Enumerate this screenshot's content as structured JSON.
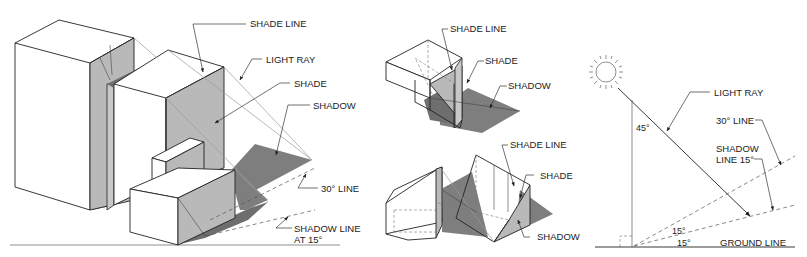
{
  "figure": {
    "left_panel": {
      "labels": {
        "shade_line": "SHADE LINE",
        "light_ray": "LIGHT RAY",
        "shade": "SHADE",
        "shadow": "SHADOW",
        "thirty_line": "30° LINE",
        "shadow_line_1": "SHADOW LINE",
        "shadow_line_2": "AT 15°"
      }
    },
    "middle_panel": {
      "top": {
        "labels": {
          "shade_line": "SHADE LINE",
          "shade": "SHADE",
          "shadow": "SHADOW"
        }
      },
      "bottom": {
        "labels": {
          "shade_line": "SHADE LINE",
          "shade": "SHADE",
          "shadow": "SHADOW"
        }
      }
    },
    "right_panel": {
      "labels": {
        "light_ray": "LIGHT RAY",
        "thirty_line": "30° LINE",
        "shadow_line_1": "SHADOW",
        "shadow_line_2": "LINE 15°",
        "angle_45": "45°",
        "angle_15_upper": "15°",
        "angle_15_lower": "15°",
        "ground_line": "GROUND LINE"
      },
      "icons": {
        "sun": "sun-icon"
      }
    },
    "colors": {
      "line": "#222222",
      "shade": "#b9b9b9",
      "shadow": "#7e7e7e",
      "background": "#ffffff"
    }
  }
}
